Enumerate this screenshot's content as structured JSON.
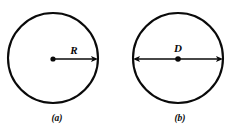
{
  "figure": {
    "background_color": "#ffffff",
    "stroke_color": "#0a0a0a",
    "width": 235,
    "height": 129,
    "panels": [
      {
        "id": "panel-a",
        "caption": "(a)",
        "caption_x": 57,
        "caption_y": 121,
        "circle": {
          "cx": 53,
          "cy": 58,
          "r": 45,
          "stroke_width": 2.1
        },
        "dimension": {
          "kind": "radius",
          "label": "R",
          "label_x": 74,
          "label_y": 54,
          "x1": 53,
          "y1": 59,
          "x2": 98,
          "y2": 59,
          "arrow_start": false,
          "arrow_end": true,
          "center_dot": true,
          "center_dot_r": 2.6
        }
      },
      {
        "id": "panel-b",
        "caption": "(b)",
        "caption_x": 180,
        "caption_y": 121,
        "circle": {
          "cx": 178,
          "cy": 58,
          "r": 45,
          "stroke_width": 2.1
        },
        "dimension": {
          "kind": "diameter",
          "label": "D",
          "label_x": 178,
          "label_y": 52,
          "x1": 133,
          "y1": 59,
          "x2": 223,
          "y2": 59,
          "arrow_start": true,
          "arrow_end": true,
          "center_dot": true,
          "center_dot_r": 2.8
        }
      }
    ],
    "label_font_size": 11,
    "caption_font_size": 9.5,
    "arrow_length": 7,
    "arrow_half_width": 3.1
  }
}
